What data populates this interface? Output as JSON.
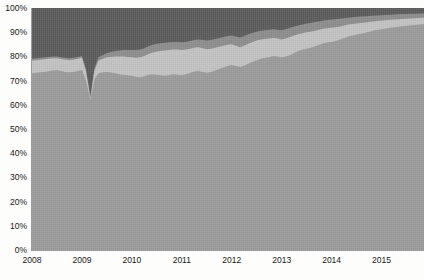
{
  "chart_data": {
    "type": "area",
    "title": "",
    "subtitle": "",
    "xlabel": "",
    "ylabel": "",
    "stacked": true,
    "normalized": true,
    "grid": false,
    "legend": "none",
    "ylim": [
      0,
      100
    ],
    "ytick_labels": [
      "0%",
      "10%",
      "20%",
      "30%",
      "40%",
      "50%",
      "60%",
      "70%",
      "80%",
      "90%",
      "100%"
    ],
    "ytick_values": [
      0,
      10,
      20,
      30,
      40,
      50,
      60,
      70,
      80,
      90,
      100
    ],
    "xtick_labels": [
      "2008",
      "2009",
      "2010",
      "2011",
      "2012",
      "2013",
      "2014",
      "2015"
    ],
    "xtick_values": [
      2008,
      2009,
      2010,
      2011,
      2012,
      2013,
      2014,
      2015
    ],
    "xlim": [
      2008,
      2015.85
    ],
    "colors": {
      "series_1": "#9a9a9a",
      "series_2": "#c2c2c2",
      "series_3": "#8c8c8c",
      "series_4": "#5a5a5a",
      "axis": "#9c9c9c",
      "text": "#181818",
      "background": "#fdfdfb"
    },
    "x": [
      2008.0,
      2008.08,
      2008.17,
      2008.25,
      2008.33,
      2008.42,
      2008.5,
      2008.58,
      2008.67,
      2008.75,
      2008.83,
      2008.92,
      2009.0,
      2009.08,
      2009.17,
      2009.25,
      2009.33,
      2009.42,
      2009.5,
      2009.58,
      2009.67,
      2009.75,
      2009.83,
      2009.92,
      2010.0,
      2010.08,
      2010.17,
      2010.25,
      2010.33,
      2010.42,
      2010.5,
      2010.58,
      2010.67,
      2010.75,
      2010.83,
      2010.92,
      2011.0,
      2011.08,
      2011.17,
      2011.25,
      2011.33,
      2011.42,
      2011.5,
      2011.58,
      2011.67,
      2011.75,
      2011.83,
      2011.92,
      2012.0,
      2012.08,
      2012.17,
      2012.25,
      2012.33,
      2012.42,
      2012.5,
      2012.58,
      2012.67,
      2012.75,
      2012.83,
      2012.92,
      2013.0,
      2013.08,
      2013.17,
      2013.25,
      2013.33,
      2013.42,
      2013.5,
      2013.58,
      2013.67,
      2013.75,
      2013.83,
      2013.92,
      2014.0,
      2014.08,
      2014.17,
      2014.25,
      2014.33,
      2014.42,
      2014.5,
      2014.58,
      2014.67,
      2014.75,
      2014.83,
      2014.92,
      2015.0,
      2015.08,
      2015.17,
      2015.25,
      2015.33,
      2015.42,
      2015.5,
      2015.58,
      2015.67,
      2015.75,
      2015.85
    ],
    "series": [
      {
        "name": "series_1",
        "description": "largest bottom band",
        "color": "#9a9a9a",
        "cumulative_top": [
          73.0,
          73.2,
          73.4,
          73.6,
          73.9,
          74.2,
          74.3,
          74.0,
          73.6,
          73.4,
          73.6,
          74.0,
          74.4,
          70.0,
          62.0,
          70.5,
          73.0,
          73.4,
          73.6,
          73.3,
          73.0,
          72.6,
          72.4,
          72.2,
          72.0,
          71.6,
          71.4,
          71.8,
          72.4,
          72.6,
          72.4,
          72.2,
          72.0,
          72.3,
          72.6,
          72.4,
          72.2,
          72.6,
          73.2,
          73.8,
          74.0,
          73.6,
          73.2,
          73.6,
          74.2,
          74.8,
          75.4,
          76.0,
          76.4,
          76.0,
          75.6,
          76.2,
          77.0,
          77.8,
          78.4,
          79.0,
          79.4,
          79.8,
          80.2,
          80.0,
          79.6,
          80.0,
          80.6,
          81.4,
          82.2,
          82.8,
          83.2,
          83.6,
          84.2,
          84.8,
          85.4,
          85.8,
          86.0,
          86.4,
          87.0,
          87.6,
          88.2,
          88.6,
          89.0,
          89.4,
          89.8,
          90.2,
          90.6,
          91.0,
          91.2,
          91.5,
          91.8,
          92.0,
          92.3,
          92.5,
          92.7,
          92.9,
          93.0,
          93.2,
          93.3
        ]
      },
      {
        "name": "series_2",
        "description": "light band above base",
        "color": "#c2c2c2",
        "cumulative_top": [
          78.2,
          78.4,
          78.6,
          78.8,
          79.0,
          79.2,
          79.2,
          78.9,
          78.6,
          78.4,
          78.6,
          79.0,
          79.4,
          74.0,
          62.6,
          74.0,
          78.2,
          79.0,
          79.6,
          79.8,
          80.0,
          80.0,
          80.0,
          79.8,
          79.6,
          79.4,
          79.6,
          80.2,
          81.0,
          81.6,
          82.0,
          82.2,
          82.4,
          82.6,
          82.8,
          82.8,
          82.6,
          82.8,
          83.2,
          83.6,
          83.8,
          83.4,
          83.0,
          83.2,
          83.6,
          84.0,
          84.4,
          84.8,
          85.0,
          84.4,
          83.8,
          84.4,
          85.2,
          86.0,
          86.6,
          87.0,
          87.2,
          87.4,
          87.6,
          87.4,
          87.0,
          87.4,
          88.0,
          88.6,
          89.2,
          89.6,
          90.0,
          90.2,
          90.6,
          91.0,
          91.4,
          91.6,
          91.8,
          92.0,
          92.4,
          92.8,
          93.2,
          93.4,
          93.6,
          93.8,
          94.0,
          94.2,
          94.4,
          94.6,
          94.7,
          94.9,
          95.1,
          95.2,
          95.4,
          95.5,
          95.6,
          95.7,
          95.8,
          95.9,
          96.0
        ]
      },
      {
        "name": "series_3",
        "description": "medium band",
        "color": "#8c8c8c",
        "cumulative_top": [
          79.0,
          79.2,
          79.4,
          79.6,
          79.8,
          80.0,
          80.0,
          79.7,
          79.4,
          79.2,
          79.4,
          79.8,
          80.2,
          75.0,
          63.4,
          75.2,
          79.6,
          80.6,
          81.4,
          81.8,
          82.2,
          82.4,
          82.6,
          82.6,
          82.6,
          82.6,
          82.8,
          83.4,
          84.2,
          84.8,
          85.2,
          85.4,
          85.6,
          85.8,
          86.0,
          86.0,
          85.8,
          86.0,
          86.4,
          86.8,
          87.0,
          86.8,
          86.6,
          86.8,
          87.2,
          87.6,
          88.0,
          88.4,
          88.6,
          88.2,
          87.8,
          88.4,
          89.2,
          89.8,
          90.2,
          90.6,
          90.8,
          91.0,
          91.2,
          91.0,
          90.8,
          91.2,
          91.8,
          92.4,
          92.8,
          93.2,
          93.6,
          93.8,
          94.2,
          94.4,
          94.8,
          95.0,
          95.2,
          95.4,
          95.6,
          95.8,
          96.0,
          96.2,
          96.4,
          96.5,
          96.6,
          96.7,
          96.8,
          96.9,
          97.0,
          97.1,
          97.2,
          97.3,
          97.4,
          97.5,
          97.5,
          97.6,
          97.6,
          97.7,
          97.7
        ]
      },
      {
        "name": "series_4",
        "description": "dark top band to 100%",
        "color": "#5a5a5a",
        "cumulative_top": [
          100,
          100,
          100,
          100,
          100,
          100,
          100,
          100,
          100,
          100,
          100,
          100,
          100,
          100,
          100,
          100,
          100,
          100,
          100,
          100,
          100,
          100,
          100,
          100,
          100,
          100,
          100,
          100,
          100,
          100,
          100,
          100,
          100,
          100,
          100,
          100,
          100,
          100,
          100,
          100,
          100,
          100,
          100,
          100,
          100,
          100,
          100,
          100,
          100,
          100,
          100,
          100,
          100,
          100,
          100,
          100,
          100,
          100,
          100,
          100,
          100,
          100,
          100,
          100,
          100,
          100,
          100,
          100,
          100,
          100,
          100,
          100,
          100,
          100,
          100,
          100,
          100,
          100,
          100,
          100,
          100,
          100,
          100,
          100,
          100,
          100,
          100,
          100,
          100,
          100,
          100,
          100,
          100,
          100,
          100
        ]
      }
    ]
  }
}
